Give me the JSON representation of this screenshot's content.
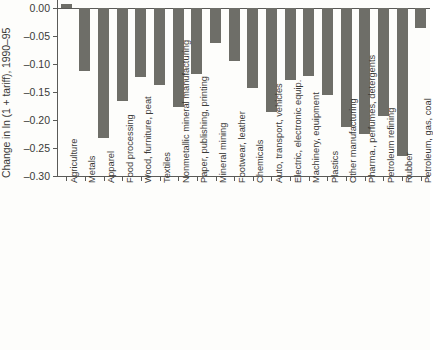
{
  "chart_data": {
    "type": "bar",
    "title": "",
    "subtitle": "",
    "xlabel": "",
    "ylabel": "Change in ln (1 + tariff), 1990–95",
    "ylim": [
      -0.3,
      0.0
    ],
    "ytick_values": [
      0.0,
      -0.05,
      -0.1,
      -0.15,
      -0.2,
      -0.25,
      -0.3
    ],
    "ytick_labels": [
      "0.00",
      "–0.05",
      "–0.10",
      "–0.15",
      "–0.20",
      "–0.25",
      "–0.30"
    ],
    "grid": false,
    "legend": false,
    "legend_position": "none",
    "bar_color": "#6e6e68",
    "axis_color": "#5a5a57",
    "background_color": "#fdfdfb",
    "orientation": "vertical",
    "categories": [
      "Agriculture",
      "Metals",
      "Apparel",
      "Food processing",
      "Wood, furniture, peat",
      "Textiles",
      "Nonmetallic mineral manufacturing",
      "Paper, publishing, printing",
      "Mineral mining",
      "Footwear, leather",
      "Chemicals",
      "Auto, transport, vehicles",
      "Electric, electronic equip.",
      "Machinery, equipment",
      "Plastics",
      "Other manufacturing",
      "Pharma., perfumes, detergents",
      "Petroleum refining",
      "Rubber",
      "Petroleum, gas, coal"
    ],
    "values": [
      0.008,
      -0.112,
      -0.233,
      -0.166,
      -0.123,
      -0.138,
      -0.177,
      -0.118,
      -0.063,
      -0.095,
      -0.143,
      -0.185,
      -0.128,
      -0.122,
      -0.155,
      -0.213,
      -0.225,
      -0.193,
      -0.265,
      -0.035
    ]
  }
}
